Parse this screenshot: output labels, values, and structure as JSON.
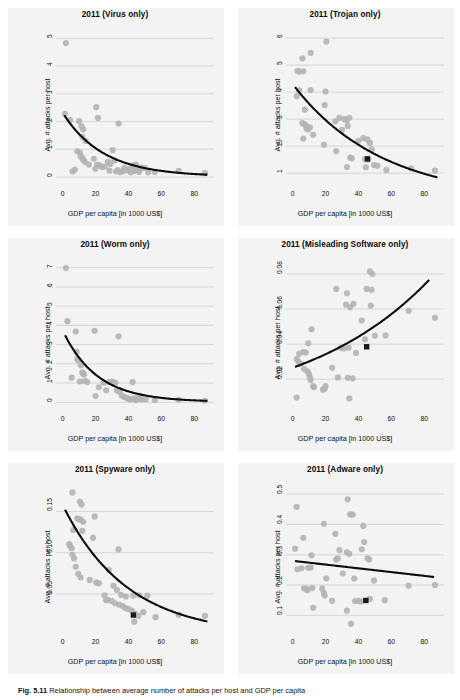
{
  "figure": {
    "caption_label": "Fig. 5.11",
    "caption_text": "Relationship between average number of attacks per host and GDP per capita"
  },
  "style": {
    "panel_bg": "#f3f3f3",
    "point_color": "#b4b4b4",
    "fit_line_color": "#0d0d0d",
    "grid_color": "#c9c9c9",
    "highlight_color": "#1a1a1a"
  },
  "common": {
    "xlabel": "GDP per capita [in 1000 US$]",
    "ylabel": "Avg. # attacks per host",
    "xticks": [
      0,
      20,
      40,
      60,
      80
    ],
    "xlim": [
      -4,
      92
    ]
  },
  "chart_data": [
    {
      "id": "virus",
      "type": "scatter",
      "title": "2011 (Virus only)",
      "xlabel": "GDP per capita [in 1000 US$]",
      "ylabel": "Avg. # attacks per host",
      "xticks": [
        0,
        20,
        40,
        60,
        80
      ],
      "yticks": [
        0,
        1,
        2,
        3,
        4,
        5
      ],
      "ytick_labels": [
        "0",
        "1",
        "2",
        "3",
        "4",
        "5"
      ],
      "xlim": [
        -4,
        92
      ],
      "ylim": [
        -0.25,
        5.3
      ],
      "grid": true,
      "legend": "none",
      "points": [
        [
          2.0,
          4.83
        ],
        [
          1.5,
          2.28
        ],
        [
          4.5,
          2.05
        ],
        [
          10.0,
          2.02
        ],
        [
          11.5,
          1.83
        ],
        [
          12.5,
          1.72
        ],
        [
          12.0,
          1.45
        ],
        [
          20.5,
          2.52
        ],
        [
          21.5,
          2.13
        ],
        [
          34.0,
          1.93
        ],
        [
          9.0,
          0.93
        ],
        [
          10.5,
          0.88
        ],
        [
          11.0,
          0.74
        ],
        [
          12.0,
          0.7
        ],
        [
          12.5,
          0.62
        ],
        [
          13.5,
          0.55
        ],
        [
          14.0,
          1.3
        ],
        [
          19.0,
          0.66
        ],
        [
          20.0,
          0.3
        ],
        [
          21.0,
          0.44
        ],
        [
          22.5,
          0.42
        ],
        [
          24.0,
          0.36
        ],
        [
          25.5,
          0.38
        ],
        [
          27.5,
          0.55
        ],
        [
          28.5,
          0.23
        ],
        [
          30.5,
          0.97
        ],
        [
          31.5,
          0.6
        ],
        [
          32.5,
          0.2
        ],
        [
          33.5,
          0.25
        ],
        [
          35.0,
          0.18
        ],
        [
          37.5,
          0.33
        ],
        [
          39.0,
          0.24
        ],
        [
          40.5,
          0.3
        ],
        [
          41.5,
          0.17
        ],
        [
          42.5,
          0.42
        ],
        [
          43.5,
          0.22
        ],
        [
          44.5,
          0.45
        ],
        [
          45.5,
          0.25
        ],
        [
          46.5,
          0.19
        ],
        [
          48.0,
          0.34
        ],
        [
          50.0,
          0.33
        ],
        [
          52.0,
          0.17
        ],
        [
          56.0,
          0.18
        ],
        [
          70.5,
          0.22
        ],
        [
          86.5,
          0.14
        ],
        [
          6.0,
          0.2
        ],
        [
          7.5,
          0.26
        ],
        [
          16.0,
          0.45
        ],
        [
          29.0,
          0.47
        ],
        [
          36.5,
          0.21
        ]
      ],
      "highlight": null,
      "fit": {
        "kind": "exp",
        "a": 2.3,
        "b": 0.0405,
        "c": 0.02,
        "x0": 1.0,
        "x1": 88.0
      }
    },
    {
      "id": "trojan",
      "type": "scatter",
      "title": "2011 (Trojan only)",
      "xlabel": "GDP per capita [in 1000 US$]",
      "ylabel": "Avg. # attacks per host",
      "xticks": [
        0,
        20,
        40,
        60,
        80
      ],
      "yticks": [
        1,
        2,
        3,
        4,
        5,
        6
      ],
      "ytick_labels": [
        "1",
        "2",
        "3",
        "4",
        "5",
        "6"
      ],
      "xlim": [
        -4,
        92
      ],
      "ylim": [
        0.6,
        6.3
      ],
      "grid": true,
      "legend": "none",
      "points": [
        [
          20.5,
          5.87
        ],
        [
          6.0,
          5.25
        ],
        [
          11.0,
          5.45
        ],
        [
          3.0,
          4.78
        ],
        [
          4.0,
          4.76
        ],
        [
          6.5,
          4.77
        ],
        [
          2.5,
          3.85
        ],
        [
          4.0,
          4.07
        ],
        [
          11.0,
          4.08
        ],
        [
          20.0,
          4.02
        ],
        [
          7.5,
          3.35
        ],
        [
          19.5,
          3.52
        ],
        [
          6.0,
          2.85
        ],
        [
          7.0,
          2.82
        ],
        [
          8.0,
          2.78
        ],
        [
          8.5,
          2.65
        ],
        [
          9.5,
          2.62
        ],
        [
          10.5,
          2.7
        ],
        [
          6.5,
          2.28
        ],
        [
          26.0,
          2.92
        ],
        [
          28.5,
          3.05
        ],
        [
          31.5,
          3.0
        ],
        [
          33.0,
          2.95
        ],
        [
          33.5,
          2.75
        ],
        [
          34.5,
          3.05
        ],
        [
          19.0,
          2.05
        ],
        [
          26.5,
          1.82
        ],
        [
          33.0,
          1.23
        ],
        [
          35.0,
          1.58
        ],
        [
          36.0,
          1.55
        ],
        [
          40.0,
          2.2
        ],
        [
          43.0,
          2.3
        ],
        [
          45.5,
          2.25
        ],
        [
          47.0,
          2.12
        ],
        [
          48.0,
          1.88
        ],
        [
          44.0,
          1.52
        ],
        [
          46.0,
          1.5
        ],
        [
          44.5,
          1.22
        ],
        [
          49.5,
          1.3
        ],
        [
          51.5,
          1.28
        ],
        [
          57.0,
          1.12
        ],
        [
          72.0,
          1.18
        ],
        [
          86.5,
          1.1
        ],
        [
          12.5,
          2.42
        ],
        [
          30.0,
          2.6
        ]
      ],
      "highlight": {
        "x": 45.5,
        "y": 1.53
      },
      "fit": {
        "kind": "exp",
        "a": 4.3,
        "b": 0.0185,
        "c": 0.0,
        "x0": 1.5,
        "x1": 88.0
      }
    },
    {
      "id": "worm",
      "type": "scatter",
      "title": "2011 (Worm only)",
      "xlabel": "GDP per capita [in 1000 US$]",
      "ylabel": "Avg. # attacks per host",
      "xticks": [
        0,
        20,
        40,
        60,
        80
      ],
      "yticks": [
        0,
        1,
        2,
        3,
        4,
        5,
        6,
        7
      ],
      "ytick_labels": [
        "0",
        "1",
        "2",
        "3",
        "4",
        "5",
        "6",
        "7"
      ],
      "xlim": [
        -4,
        92
      ],
      "ylim": [
        -0.35,
        7.4
      ],
      "grid": true,
      "legend": "none",
      "points": [
        [
          2.0,
          6.98
        ],
        [
          3.0,
          4.22
        ],
        [
          8.0,
          3.68
        ],
        [
          19.5,
          3.72
        ],
        [
          34.0,
          3.43
        ],
        [
          8.5,
          2.62
        ],
        [
          9.0,
          2.25
        ],
        [
          9.5,
          2.18
        ],
        [
          11.0,
          1.92
        ],
        [
          12.0,
          1.55
        ],
        [
          12.5,
          1.48
        ],
        [
          13.0,
          1.45
        ],
        [
          13.5,
          1.12
        ],
        [
          5.5,
          1.28
        ],
        [
          10.5,
          1.08
        ],
        [
          20.0,
          0.32
        ],
        [
          22.0,
          0.78
        ],
        [
          25.0,
          1.02
        ],
        [
          28.0,
          1.05
        ],
        [
          30.0,
          1.08
        ],
        [
          32.0,
          1.02
        ],
        [
          33.0,
          0.62
        ],
        [
          34.5,
          0.55
        ],
        [
          36.0,
          0.35
        ],
        [
          37.5,
          0.28
        ],
        [
          39.0,
          0.22
        ],
        [
          40.0,
          0.18
        ],
        [
          41.0,
          0.15
        ],
        [
          42.5,
          1.05
        ],
        [
          43.5,
          0.2
        ],
        [
          44.5,
          0.12
        ],
        [
          45.5,
          0.22
        ],
        [
          46.5,
          0.17
        ],
        [
          48.0,
          0.15
        ],
        [
          50.5,
          0.15
        ],
        [
          56.0,
          0.12
        ],
        [
          70.5,
          0.13
        ],
        [
          86.5,
          0.08
        ],
        [
          15.0,
          1.05
        ],
        [
          26.5,
          0.62
        ]
      ],
      "highlight": null,
      "fit": {
        "kind": "exp",
        "a": 3.72,
        "b": 0.048,
        "c": 0.02,
        "x0": 1.5,
        "x1": 88.0
      }
    },
    {
      "id": "misleading",
      "type": "scatter",
      "title": "2011 (Misleading Software only)",
      "xlabel": "GDP per capita [in 1000 US$]",
      "ylabel": "Avg. # attacks per host",
      "xticks": [
        0,
        20,
        40,
        60,
        80
      ],
      "yticks": [
        0.02,
        0.04,
        0.06,
        0.08
      ],
      "ytick_labels": [
        "0.02",
        "0.04",
        "0.06",
        "0.08"
      ],
      "xlim": [
        -4,
        92
      ],
      "ylim": [
        0.003,
        0.088
      ],
      "grid": true,
      "legend": "none",
      "points": [
        [
          47.0,
          0.0815
        ],
        [
          48.5,
          0.08
        ],
        [
          26.5,
          0.0715
        ],
        [
          45.0,
          0.0715
        ],
        [
          48.0,
          0.071
        ],
        [
          33.0,
          0.069
        ],
        [
          32.5,
          0.0625
        ],
        [
          37.0,
          0.063
        ],
        [
          47.5,
          0.062
        ],
        [
          35.0,
          0.061
        ],
        [
          70.5,
          0.059
        ],
        [
          86.5,
          0.055
        ],
        [
          42.0,
          0.0535
        ],
        [
          11.5,
          0.0485
        ],
        [
          9.5,
          0.0405
        ],
        [
          44.0,
          0.0428
        ],
        [
          50.0,
          0.0448
        ],
        [
          56.5,
          0.045
        ],
        [
          4.0,
          0.0345
        ],
        [
          6.5,
          0.0355
        ],
        [
          8.0,
          0.0352
        ],
        [
          2.5,
          0.0315
        ],
        [
          3.5,
          0.03
        ],
        [
          5.0,
          0.0288
        ],
        [
          29.5,
          0.038
        ],
        [
          31.0,
          0.0375
        ],
        [
          34.0,
          0.038
        ],
        [
          38.5,
          0.035
        ],
        [
          7.0,
          0.0258
        ],
        [
          9.0,
          0.0245
        ],
        [
          10.0,
          0.023
        ],
        [
          10.5,
          0.021
        ],
        [
          11.0,
          0.0195
        ],
        [
          12.5,
          0.016
        ],
        [
          13.0,
          0.0155
        ],
        [
          18.5,
          0.014
        ],
        [
          19.5,
          0.0145
        ],
        [
          24.0,
          0.0265
        ],
        [
          27.5,
          0.021
        ],
        [
          33.5,
          0.0208
        ],
        [
          36.5,
          0.0205
        ],
        [
          2.5,
          0.0095
        ],
        [
          34.5,
          0.009
        ],
        [
          20.0,
          0.016
        ]
      ],
      "highlight": {
        "x": 45.0,
        "y": 0.0385
      },
      "fit": {
        "kind": "exp_up",
        "a": 0.0265,
        "b": 0.0128,
        "x0": 1.5,
        "x1": 83.0
      }
    },
    {
      "id": "spyware",
      "type": "scatter",
      "title": "2011 (Spyware only)",
      "xlabel": "GDP per capita [in 1000 US$]",
      "ylabel": "Avg. # attacks per host",
      "xticks": [
        0,
        20,
        40,
        60,
        80
      ],
      "yticks": [
        0.05,
        0.1,
        0.15
      ],
      "ytick_labels": [
        "0.05",
        "0.10",
        "0.15"
      ],
      "xlim": [
        -4,
        92
      ],
      "ylim": [
        0.004,
        0.182
      ],
      "grid": true,
      "legend": "none",
      "points": [
        [
          6.0,
          0.173
        ],
        [
          10.5,
          0.162
        ],
        [
          11.5,
          0.1585
        ],
        [
          9.0,
          0.1415
        ],
        [
          10.0,
          0.1405
        ],
        [
          11.0,
          0.14
        ],
        [
          12.5,
          0.1375
        ],
        [
          19.5,
          0.144
        ],
        [
          6.5,
          0.1275
        ],
        [
          12.0,
          0.1265
        ],
        [
          4.0,
          0.1105
        ],
        [
          4.5,
          0.1085
        ],
        [
          5.5,
          0.1055
        ],
        [
          6.0,
          0.0975
        ],
        [
          7.0,
          0.093
        ],
        [
          18.5,
          0.118
        ],
        [
          34.0,
          0.104
        ],
        [
          8.0,
          0.083
        ],
        [
          9.5,
          0.0745
        ],
        [
          11.0,
          0.07
        ],
        [
          16.5,
          0.067
        ],
        [
          20.5,
          0.064
        ],
        [
          22.0,
          0.063
        ],
        [
          28.0,
          0.079
        ],
        [
          31.0,
          0.06
        ],
        [
          25.5,
          0.0485
        ],
        [
          26.5,
          0.0425
        ],
        [
          27.5,
          0.043
        ],
        [
          33.0,
          0.055
        ],
        [
          35.5,
          0.049
        ],
        [
          38.5,
          0.047
        ],
        [
          43.0,
          0.048
        ],
        [
          46.5,
          0.0485
        ],
        [
          51.5,
          0.048
        ],
        [
          30.0,
          0.0415
        ],
        [
          32.0,
          0.0385
        ],
        [
          34.5,
          0.037
        ],
        [
          36.5,
          0.0355
        ],
        [
          38.0,
          0.033
        ],
        [
          40.0,
          0.032
        ],
        [
          42.0,
          0.03
        ],
        [
          44.0,
          0.0265
        ],
        [
          46.0,
          0.0235
        ],
        [
          49.0,
          0.028
        ],
        [
          56.5,
          0.022
        ],
        [
          70.5,
          0.025
        ],
        [
          86.5,
          0.0235
        ],
        [
          43.5,
          0.0165
        ]
      ],
      "highlight": {
        "x": 43.0,
        "y": 0.0245
      },
      "fit": {
        "kind": "exp",
        "a": 0.158,
        "b": 0.0255,
        "c": 0.0,
        "x0": 1.5,
        "x1": 88.0
      }
    },
    {
      "id": "adware",
      "type": "scatter",
      "title": "2011 (Adware only)",
      "xlabel": "GDP per capita [in 1000 US$]",
      "ylabel": "Avg. # attacks per host",
      "xticks": [
        0,
        20,
        40,
        60,
        80
      ],
      "yticks": [
        0.1,
        0.2,
        0.3,
        0.4,
        0.5
      ],
      "ytick_labels": [
        "0.1",
        "0.2",
        "0.3",
        "0.4",
        "0.5"
      ],
      "xlim": [
        -4,
        92
      ],
      "ylim": [
        0.045,
        0.53
      ],
      "grid": true,
      "legend": "none",
      "points": [
        [
          33.5,
          0.483
        ],
        [
          2.5,
          0.458
        ],
        [
          35.0,
          0.433
        ],
        [
          36.5,
          0.4325
        ],
        [
          19.0,
          0.402
        ],
        [
          43.0,
          0.395
        ],
        [
          6.5,
          0.356
        ],
        [
          26.0,
          0.369
        ],
        [
          43.5,
          0.342
        ],
        [
          1.5,
          0.32
        ],
        [
          28.5,
          0.315
        ],
        [
          33.0,
          0.308
        ],
        [
          34.5,
          0.303
        ],
        [
          42.0,
          0.318
        ],
        [
          11.5,
          0.298
        ],
        [
          26.5,
          0.284
        ],
        [
          27.5,
          0.288
        ],
        [
          45.5,
          0.288
        ],
        [
          46.5,
          0.2845
        ],
        [
          5.5,
          0.256
        ],
        [
          9.5,
          0.257
        ],
        [
          11.0,
          0.258
        ],
        [
          3.0,
          0.252
        ],
        [
          20.5,
          0.222
        ],
        [
          30.5,
          0.238
        ],
        [
          37.5,
          0.2215
        ],
        [
          49.5,
          0.215
        ],
        [
          70.5,
          0.198
        ],
        [
          86.5,
          0.2
        ],
        [
          7.0,
          0.189
        ],
        [
          8.5,
          0.188
        ],
        [
          9.0,
          0.183
        ],
        [
          12.0,
          0.19
        ],
        [
          18.0,
          0.188
        ],
        [
          19.0,
          0.174
        ],
        [
          19.5,
          0.1655
        ],
        [
          12.5,
          0.125
        ],
        [
          24.0,
          0.148
        ],
        [
          38.0,
          0.147
        ],
        [
          40.0,
          0.148
        ],
        [
          41.5,
          0.1455
        ],
        [
          47.0,
          0.154
        ],
        [
          56.0,
          0.15
        ],
        [
          33.0,
          0.1155
        ],
        [
          35.5,
          0.072
        ]
      ],
      "highlight": {
        "x": 44.5,
        "y": 0.149
      },
      "fit": {
        "kind": "linear",
        "y0": 0.279,
        "y1": 0.2265,
        "x0": 1.5,
        "x1": 86.0
      }
    }
  ]
}
